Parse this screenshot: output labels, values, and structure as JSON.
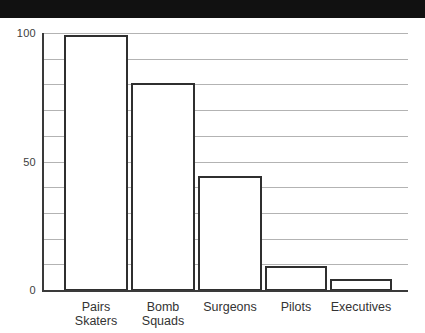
{
  "banner": {
    "name": "top-black-band",
    "color": "#111111"
  },
  "chart_data": {
    "type": "bar",
    "title": "",
    "subtitle": "",
    "xlabel": "",
    "ylabel": "",
    "categories": [
      "Pairs Skaters",
      "Bomb Squads",
      "Surgeons",
      "Pilots",
      "Executives"
    ],
    "category_lines": [
      [
        "Pairs",
        "Skaters"
      ],
      [
        "Bomb",
        "Squads"
      ],
      [
        "Surgeons"
      ],
      [
        "Pilots"
      ],
      [
        "Executives"
      ]
    ],
    "values": [
      99,
      80,
      44,
      9,
      4
    ],
    "ylim": [
      0,
      100
    ],
    "xlim_note": "categorical",
    "ytick_labels": [
      "0",
      "50",
      "100"
    ],
    "ytick_values": [
      0,
      50,
      100
    ],
    "gridline_values": [
      10,
      20,
      30,
      40,
      50,
      60,
      70,
      80,
      90,
      100
    ],
    "grid": true,
    "grid_orientation": "horizontal",
    "legend": null,
    "legend_position": "none",
    "annotations": [],
    "bar_fill": "#ffffff",
    "bar_stroke": "#2f2f2f",
    "gridline_color": "#b3b3b3",
    "axis_color": "#3a3a3a",
    "background": "#ffffff"
  },
  "geometry": {
    "plot_left": 42,
    "plot_right": 408,
    "plot_top": 15,
    "plot_bottom": 272,
    "bars": [
      {
        "x": 64,
        "width": 64
      },
      {
        "x": 131,
        "width": 64
      },
      {
        "x": 198,
        "width": 64
      },
      {
        "x": 265,
        "width": 62
      },
      {
        "x": 330,
        "width": 62
      }
    ]
  }
}
